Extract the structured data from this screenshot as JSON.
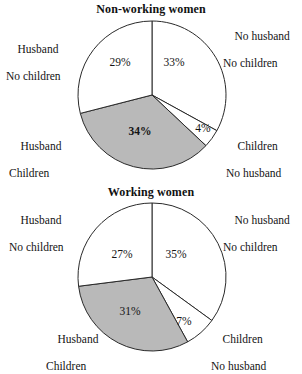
{
  "page": {
    "width": 302,
    "height": 368,
    "background": "#ffffff",
    "shaded_color": "#b9b9b9",
    "unshaded_color": "#ffffff",
    "outline_color": "#2a2a2a"
  },
  "charts": [
    {
      "id": "non-working-women",
      "title": "Non-working women",
      "center": {
        "x": 152,
        "y": 95
      },
      "radius": 74,
      "labels": {
        "top_left": {
          "line1": "Husband",
          "line2": "No children"
        },
        "top_right": {
          "line1": "No husband",
          "line2": "No children"
        },
        "bottom_left": {
          "line1": "Husband",
          "line2": "Children"
        },
        "bottom_right": {
          "line1": "Children",
          "line2": "No husband"
        }
      }
    },
    {
      "id": "working-women",
      "title": "Working women",
      "center": {
        "x": 152,
        "y": 93
      },
      "radius": 74,
      "labels": {
        "top_left": {
          "line1": "Husband",
          "line2": "No children"
        },
        "top_right": {
          "line1": "No husband",
          "line2": "No children"
        },
        "bottom_left": {
          "line1": "Husband",
          "line2": "Children"
        },
        "bottom_right": {
          "line1": "Children",
          "line2": "No husband"
        }
      }
    }
  ],
  "chart_data": [
    {
      "type": "pie",
      "title": "Non-working women",
      "categories": [
        "No husband, No children",
        "Children, No husband",
        "Husband, Children",
        "Husband, No children"
      ],
      "values": [
        33,
        4,
        34,
        29
      ],
      "value_labels": [
        "33%",
        "4%",
        "34%",
        "29%"
      ],
      "colors": [
        "#ffffff",
        "#ffffff",
        "#b9b9b9",
        "#ffffff"
      ],
      "start_angle_deg": 0,
      "direction": "clockwise",
      "legend": "corner-labels",
      "annotations": [
        {
          "text": "Husband\nNo children",
          "position": "top-left"
        },
        {
          "text": "No husband\nNo children",
          "position": "top-right"
        },
        {
          "text": "Husband\nChildren",
          "position": "bottom-left"
        },
        {
          "text": "Children\nNo husband",
          "position": "bottom-right"
        }
      ]
    },
    {
      "type": "pie",
      "title": "Working women",
      "categories": [
        "No husband, No children",
        "Children, No husband",
        "Husband, Children",
        "Husband, No children"
      ],
      "values": [
        35,
        7,
        31,
        27
      ],
      "value_labels": [
        "35%",
        "7%",
        "31%",
        "27%"
      ],
      "colors": [
        "#ffffff",
        "#ffffff",
        "#b9b9b9",
        "#ffffff"
      ],
      "start_angle_deg": 0,
      "direction": "clockwise",
      "legend": "corner-labels",
      "annotations": [
        {
          "text": "Husband\nNo children",
          "position": "top-left"
        },
        {
          "text": "No husband\nNo children",
          "position": "top-right"
        },
        {
          "text": "Husband\nChildren",
          "position": "bottom-left"
        },
        {
          "text": "Children\nNo husband",
          "position": "bottom-right"
        }
      ]
    }
  ]
}
